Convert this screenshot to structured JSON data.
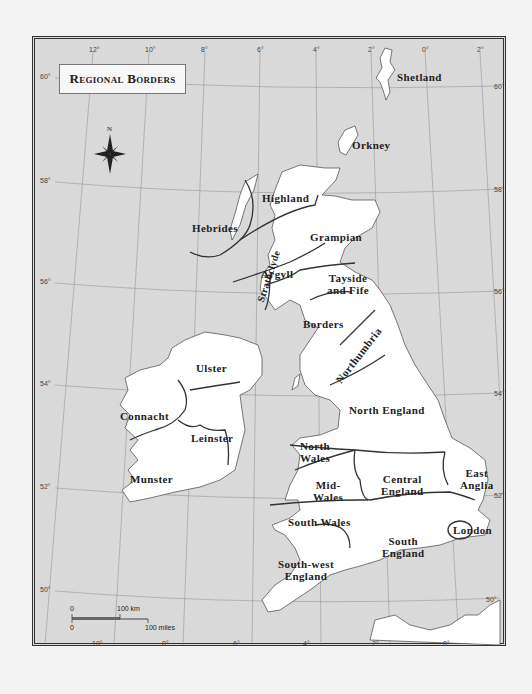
{
  "title": "Regional Borders",
  "compass": {
    "label": "N"
  },
  "longitude_ticks_top": [
    "12°",
    "10°",
    "8°",
    "6°",
    "4°",
    "2°",
    "0°",
    "2°"
  ],
  "longitude_ticks_bottom": [
    "10°",
    "8°",
    "6°",
    "4°",
    "2°",
    "0°"
  ],
  "latitude_ticks_left": [
    "60°",
    "58°",
    "56°",
    "54°",
    "52°",
    "50°"
  ],
  "latitude_ticks_right": [
    "60°",
    "58°",
    "56°",
    "54°",
    "52°",
    "50°"
  ],
  "regions": {
    "shetland": "Shetland",
    "orkney": "Orkney",
    "highland": "Highland",
    "hebrides": "Hebrides",
    "grampian": "Grampian",
    "argyll": "Argyll",
    "tayside": "Tayside\nand Fife",
    "strathclyde": "Strathclyde",
    "borders": "Borders",
    "northumbria": "Northumbria",
    "ulster": "Ulster",
    "connacht": "Connacht",
    "leinster": "Leinster",
    "munster": "Munster",
    "north_england": "North England",
    "north_wales": "North\nWales",
    "mid_wales": "Mid-\nWales",
    "central_england": "Central\nEngland",
    "east_anglia": "East\nAnglia",
    "south_wales": "South Wales",
    "london": "London",
    "south_england": "South\nEngland",
    "south_west_england": "South-west\nEngland"
  },
  "scale_bar": {
    "zero_top": "0",
    "km_label": "100 km",
    "zero_bottom": "0",
    "miles_label": "100 miles"
  },
  "colors": {
    "sea": "#d9d9d9",
    "land": "#ffffff",
    "border": "#333333"
  }
}
